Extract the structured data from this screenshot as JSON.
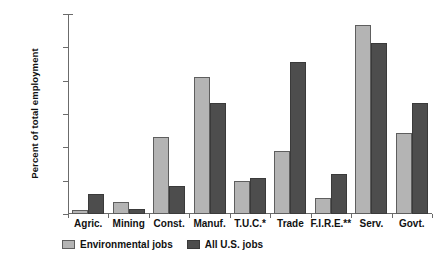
{
  "chart_data": {
    "type": "bar",
    "title": "",
    "xlabel": "",
    "ylabel": "Percent of total employment",
    "ylim": [
      0,
      30
    ],
    "grid": false,
    "legend_position": "bottom-left",
    "y_tick_labels": [
      "0.00%",
      "5.00%",
      "10.00%",
      "15.00%",
      "20.00%",
      "25.00%",
      "30.00%"
    ],
    "y_tick_values": [
      0,
      5,
      10,
      15,
      20,
      25,
      30
    ],
    "categories": [
      "Agric.",
      "Mining",
      "Const.",
      "Manuf.",
      "T.U.C.*",
      "Trade",
      "F.I.R.E.**",
      "Serv.",
      "Govt."
    ],
    "series": [
      {
        "name": "Environmental jobs",
        "color": "#b4b4b4",
        "values": [
          0.6,
          1.8,
          11.6,
          20.6,
          5.0,
          9.5,
          2.4,
          28.3,
          12.1
        ]
      },
      {
        "name": "All U.S. jobs",
        "color": "#4d4d4d",
        "values": [
          3.0,
          0.7,
          4.2,
          16.7,
          5.4,
          22.8,
          6.0,
          25.6,
          16.7
        ]
      }
    ]
  }
}
